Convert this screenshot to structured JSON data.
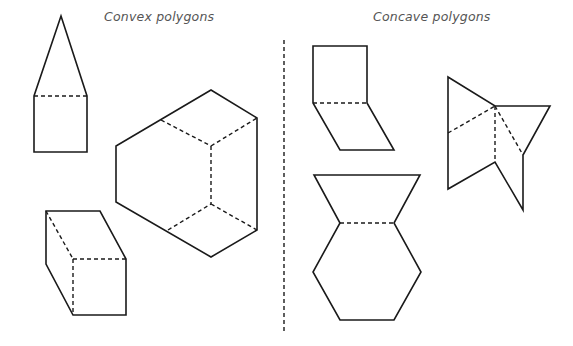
{
  "diagram": {
    "titles": {
      "convex": "Convex polygons",
      "concave": "Concave polygons"
    },
    "divider": {
      "style": "dashed",
      "x": 284
    },
    "colors": {
      "stroke": "#1a1a1a",
      "title": "#555555",
      "background": "#ffffff"
    },
    "shapes": [
      {
        "id": "house-pentagon",
        "group": "convex",
        "outline": [
          [
            61,
            16
          ],
          [
            87,
            96
          ],
          [
            87,
            152
          ],
          [
            34,
            152
          ],
          [
            34,
            96
          ]
        ],
        "dashed_lines": [
          [
            [
              34,
              96
            ],
            [
              87,
              96
            ]
          ]
        ]
      },
      {
        "id": "large-hexagon",
        "group": "convex",
        "outline": [
          [
            211,
            90
          ],
          [
            257,
            118
          ],
          [
            257,
            230
          ],
          [
            211,
            257
          ],
          [
            116,
            202
          ],
          [
            116,
            146
          ]
        ],
        "dashed_lines": [
          [
            [
              161,
              120
            ],
            [
              211,
              146
            ]
          ],
          [
            [
              211,
              146
            ],
            [
              257,
              118
            ]
          ],
          [
            [
              211,
              146
            ],
            [
              211,
              204
            ]
          ],
          [
            [
              168,
              230
            ],
            [
              211,
              204
            ]
          ],
          [
            [
              211,
              204
            ],
            [
              257,
              230
            ]
          ]
        ]
      },
      {
        "id": "prism-hexagon",
        "group": "convex",
        "outline": [
          [
            46,
            211
          ],
          [
            100,
            211
          ],
          [
            126,
            259
          ],
          [
            126,
            315
          ],
          [
            73,
            315
          ],
          [
            46,
            264
          ]
        ],
        "dashed_lines": [
          [
            [
              46,
              211
            ],
            [
              73,
              259
            ]
          ],
          [
            [
              73,
              259
            ],
            [
              126,
              259
            ]
          ],
          [
            [
              73,
              259
            ],
            [
              73,
              315
            ]
          ]
        ]
      },
      {
        "id": "bent-parallelograms",
        "group": "concave",
        "outline": [
          [
            313,
            46
          ],
          [
            367,
            46
          ],
          [
            367,
            103
          ],
          [
            394,
            150
          ],
          [
            340,
            150
          ],
          [
            313,
            103
          ]
        ],
        "dashed_lines": [
          [
            [
              313,
              103
            ],
            [
              367,
              103
            ]
          ]
        ]
      },
      {
        "id": "bowtie-star",
        "group": "concave",
        "outline": [
          [
            448,
            77
          ],
          [
            495,
            106
          ],
          [
            550,
            106
          ],
          [
            523,
            155
          ],
          [
            523,
            210
          ],
          [
            495,
            162
          ],
          [
            448,
            189
          ]
        ],
        "dashed_lines": [
          [
            [
              448,
              133
            ],
            [
              495,
              106
            ]
          ],
          [
            [
              495,
              106
            ],
            [
              495,
              162
            ]
          ],
          [
            [
              495,
              106
            ],
            [
              523,
              155
            ]
          ]
        ]
      },
      {
        "id": "vase",
        "group": "concave",
        "outline": [
          [
            314,
            175
          ],
          [
            420,
            175
          ],
          [
            394,
            223
          ],
          [
            421,
            272
          ],
          [
            394,
            320
          ],
          [
            340,
            320
          ],
          [
            313,
            272
          ],
          [
            340,
            223
          ]
        ],
        "dashed_lines": [
          [
            [
              340,
              223
            ],
            [
              394,
              223
            ]
          ]
        ]
      }
    ]
  }
}
